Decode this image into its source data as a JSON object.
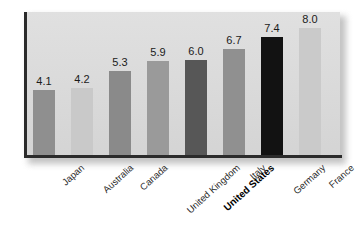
{
  "chart_data": {
    "type": "bar",
    "title": "",
    "subtitle": "",
    "xlabel": "",
    "ylabel": "",
    "ylim": [
      0,
      9.0
    ],
    "grid": false,
    "legend": null,
    "categories": [
      "Japan",
      "Australia",
      "Canada",
      "United Kingdom",
      "United States",
      "Italy",
      "Germany",
      "France"
    ],
    "values": [
      4.1,
      4.2,
      5.3,
      5.9,
      6.0,
      6.7,
      7.4,
      8.0
    ],
    "value_labels": [
      "4.1",
      "4.2",
      "5.3",
      "5.9",
      "6.0",
      "6.7",
      "7.4",
      "8.0"
    ],
    "bar_colors": [
      "#8f8f8f",
      "#c9c9c9",
      "#8a8a8a",
      "#9a9a9a",
      "#575757",
      "#909090",
      "#121212",
      "#cacaca"
    ],
    "highlight_category": "United States",
    "panel_color": "#dcdcdc",
    "axis_color": "#2b2b2b"
  }
}
